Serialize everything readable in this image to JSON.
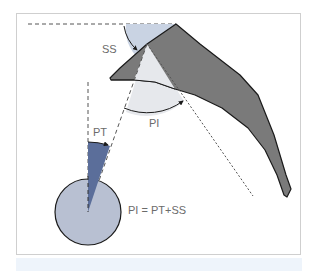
{
  "diagram": {
    "labels": {
      "ss": "SS",
      "pi": "PI",
      "pt": "PT",
      "formula": "PI = PT+SS"
    },
    "colors": {
      "sacrum_fill": "#7a7a7a",
      "outline": "#1a1a1a",
      "ss_arc_fill": "#c9d3e3",
      "pi_arc_fill": "#e6e8ec",
      "pt_wedge_fill": "#5b6e9a",
      "femoral_head_fill": "#b8c0d2",
      "dashed_line": "#555555",
      "frame_border": "#cfcfcf",
      "label_text": "#6b6b6b"
    }
  }
}
